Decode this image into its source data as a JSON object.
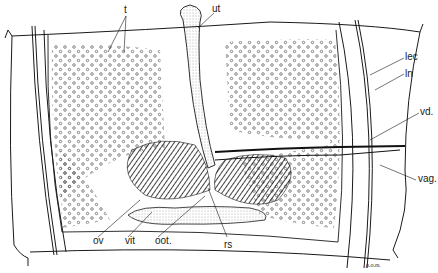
{
  "figure": {
    "type": "anatomical line drawing",
    "colors": {
      "ink": "#1a1a1a",
      "paper": "#ffffff",
      "stipple": "#555555"
    }
  },
  "labels": {
    "t": "t",
    "ut": "ut",
    "lec": "lec",
    "ln": "ln",
    "vd": "vd.",
    "vag": "vag.",
    "ov": "ov",
    "vit": "vit",
    "oot": "oot.",
    "rs": "rs"
  },
  "signature": "ρ.o.m."
}
